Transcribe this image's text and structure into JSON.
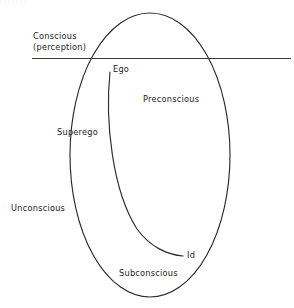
{
  "diagram": {
    "type": "concept-diagram",
    "canvas": {
      "width": 294,
      "height": 308,
      "background": "#ffffff"
    },
    "stroke_color": "#2b2b2b",
    "text_color": "#1d1d1d",
    "labels": {
      "conscious_line1": "Conscious",
      "conscious_line2": "(perception)",
      "ego": "Ego",
      "preconscious": "Preconscious",
      "superego": "Superego",
      "unconscious": "Unconscious",
      "id": "Id",
      "subconscious": "Subconscious"
    },
    "shapes": {
      "outer_ellipse": {
        "name": "psyche-ellipse",
        "cx": 150,
        "cy": 155,
        "rx": 80,
        "ry": 142
      },
      "inner_arc": {
        "name": "ego-id-arc",
        "start": [
          110,
          72
        ],
        "end": [
          183,
          256
        ]
      },
      "consciousness_line": {
        "name": "consciousness-threshold-line",
        "x1": 32,
        "y1": 58,
        "x2": 291,
        "y2": 58
      }
    }
  }
}
